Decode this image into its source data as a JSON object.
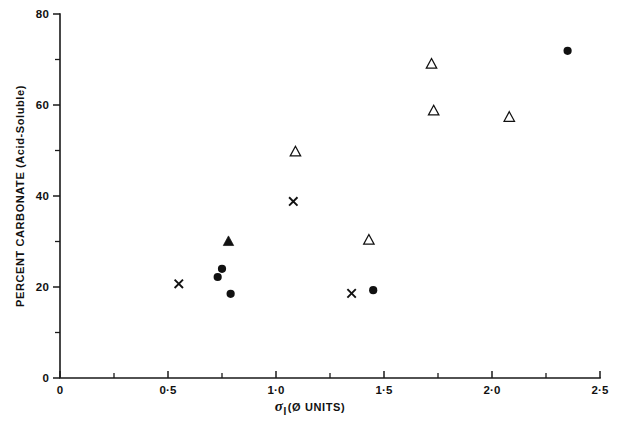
{
  "chart_data": {
    "type": "scatter",
    "title": "",
    "xlabel": "σ_I (Ø UNITS)",
    "ylabel": "PERCENT CARBONATE (Acid-Soluble)",
    "xlim": [
      0,
      2.5
    ],
    "ylim": [
      0,
      80
    ],
    "grid": false,
    "legend_position": "none",
    "x_ticks": [
      {
        "value": 0,
        "label": "0",
        "type": "major"
      },
      {
        "value": 0.25,
        "label": "",
        "type": "minor"
      },
      {
        "value": 0.5,
        "label": "0·5",
        "type": "major"
      },
      {
        "value": 0.75,
        "label": "",
        "type": "minor"
      },
      {
        "value": 1.0,
        "label": "1·0",
        "type": "major"
      },
      {
        "value": 1.25,
        "label": "",
        "type": "minor"
      },
      {
        "value": 1.5,
        "label": "1·5",
        "type": "major"
      },
      {
        "value": 1.75,
        "label": "",
        "type": "minor"
      },
      {
        "value": 2.0,
        "label": "2·0",
        "type": "major"
      },
      {
        "value": 2.25,
        "label": "",
        "type": "minor"
      },
      {
        "value": 2.5,
        "label": "2·5",
        "type": "major"
      }
    ],
    "y_ticks": [
      {
        "value": 0,
        "label": "0",
        "type": "major"
      },
      {
        "value": 10,
        "label": "",
        "type": "minor"
      },
      {
        "value": 20,
        "label": "20",
        "type": "major"
      },
      {
        "value": 30,
        "label": "",
        "type": "minor"
      },
      {
        "value": 40,
        "label": "40",
        "type": "major"
      },
      {
        "value": 50,
        "label": "",
        "type": "minor"
      },
      {
        "value": 60,
        "label": "60",
        "type": "major"
      },
      {
        "value": 70,
        "label": "",
        "type": "minor"
      },
      {
        "value": 80,
        "label": "80",
        "type": "major"
      }
    ],
    "series": [
      {
        "name": "filled-circle",
        "marker": "filled-circle",
        "color": "#111111",
        "points": [
          {
            "x": 0.73,
            "y": 22.2
          },
          {
            "x": 0.75,
            "y": 24.0
          },
          {
            "x": 0.79,
            "y": 18.5
          },
          {
            "x": 1.45,
            "y": 19.3
          },
          {
            "x": 2.35,
            "y": 71.9
          }
        ]
      },
      {
        "name": "open-triangle",
        "marker": "open-triangle",
        "color": "#111111",
        "points": [
          {
            "x": 1.09,
            "y": 49.7
          },
          {
            "x": 1.43,
            "y": 30.3
          },
          {
            "x": 1.72,
            "y": 69.0
          },
          {
            "x": 1.73,
            "y": 58.7
          },
          {
            "x": 2.08,
            "y": 57.3
          }
        ]
      },
      {
        "name": "filled-triangle",
        "marker": "filled-triangle",
        "color": "#111111",
        "points": [
          {
            "x": 0.78,
            "y": 30.0
          }
        ]
      },
      {
        "name": "cross",
        "marker": "cross",
        "color": "#111111",
        "points": [
          {
            "x": 0.55,
            "y": 20.7
          },
          {
            "x": 1.08,
            "y": 38.8
          },
          {
            "x": 1.35,
            "y": 18.6
          }
        ]
      }
    ]
  },
  "axes": {
    "x_title_sigma": "σ",
    "x_title_subscript": "I",
    "x_title_units": "(Ø UNITS)",
    "y_title": "PERCENT CARBONATE (Acid-Soluble)"
  }
}
